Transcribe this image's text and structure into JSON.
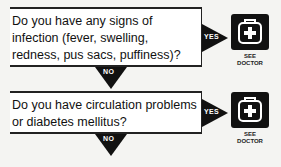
{
  "flowchart": {
    "steps": [
      {
        "question": "Do you have any signs of infection (fever, swelling, redness, pus sacs, puffiness)?",
        "yes_label": "YES",
        "no_label": "NO",
        "outcome_icon": "doctor-bag-icon",
        "outcome_caption_line1": "SEE",
        "outcome_caption_line2": "DOCTOR"
      },
      {
        "question": "Do you have circulation problems or diabetes mellitus?",
        "yes_label": "YES",
        "no_label": "NO",
        "outcome_icon": "doctor-bag-icon",
        "outcome_caption_line1": "SEE",
        "outcome_caption_line2": "DOCTOR"
      }
    ],
    "colors": {
      "arrow": "#111111",
      "box_border": "#222222",
      "box_fill": "#ffffff",
      "background": "#f4f4f2"
    }
  }
}
